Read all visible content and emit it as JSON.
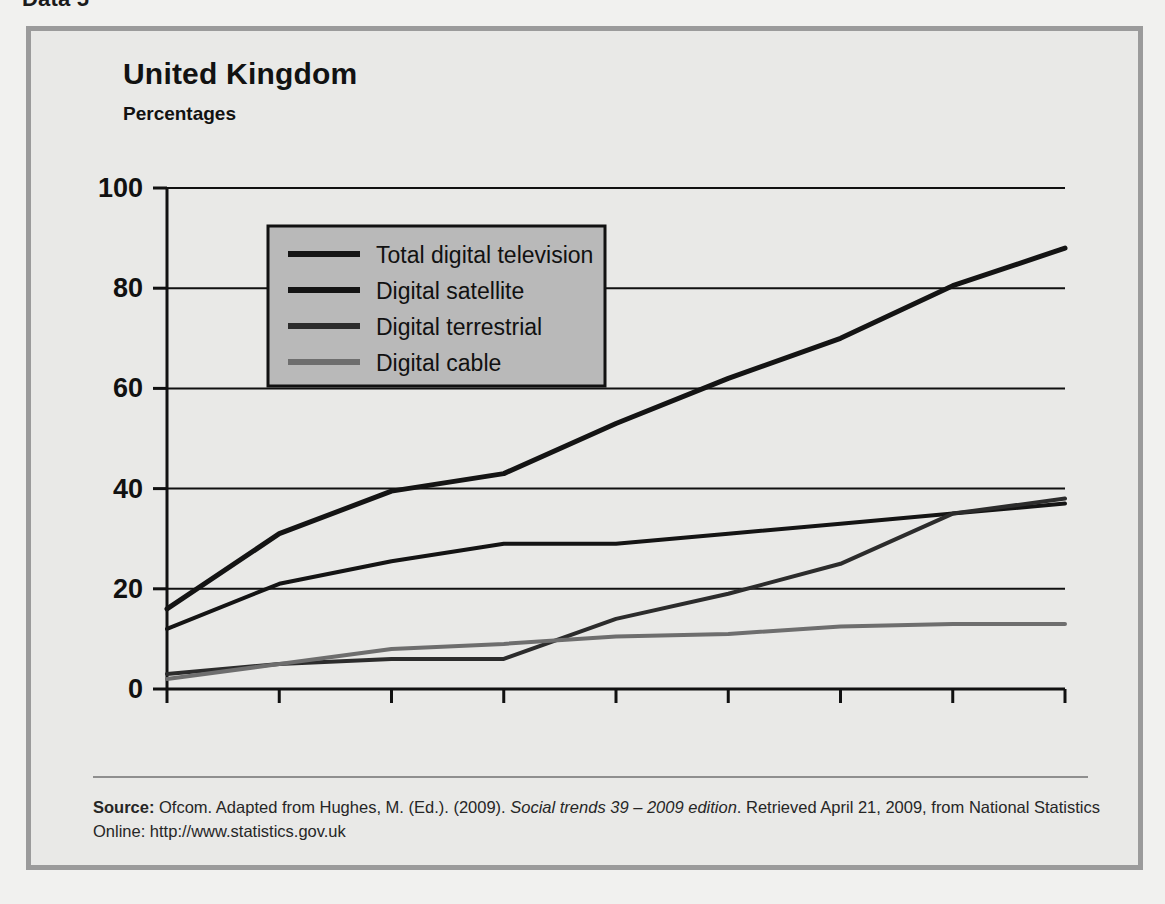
{
  "crop_caption": "Data 5",
  "figure": {
    "title": "United Kingdom",
    "subtitle": "Percentages"
  },
  "source": {
    "label": "Source:",
    "text_before_italic": " Ofcom. Adapted from Hughes, M. (Ed.). (2009). ",
    "italic_text": "Social trends 39 – 2009 edition",
    "text_after_italic": ". Retrieved April 21, 2009, from National Statistics Online: http://www.statistics.gov.uk"
  },
  "colors": {
    "panel_background": "#e9e9e7",
    "frame_border": "#9b9b9b",
    "axis": "#111111",
    "gridline": "#111111",
    "legend_background": "#b9b9b9",
    "legend_border": "#111111",
    "series_dark": "#141414",
    "series_gray": "#6e6e6e",
    "source_rule": "#8f8f8f"
  },
  "chart_data": {
    "type": "line",
    "title": "United Kingdom",
    "subtitle": "Percentages",
    "xlabel": "",
    "ylabel": "Percentages",
    "categories": [
      "2000",
      "2001",
      "2002",
      "2003",
      "2004",
      "2005",
      "2006",
      "2007",
      "2008"
    ],
    "x": [
      2000,
      2001,
      2002,
      2003,
      2004,
      2005,
      2006,
      2007,
      2008
    ],
    "ylim": [
      0,
      100
    ],
    "yticks": [
      0,
      20,
      40,
      60,
      80,
      100
    ],
    "ytick_labels": [
      "0",
      "20",
      "40",
      "60",
      "80",
      "100"
    ],
    "grid": "horizontal",
    "legend_position": "upper-left-inside",
    "series": [
      {
        "name": "Total digital television",
        "color": "#141414",
        "width": 5,
        "values": [
          16,
          31,
          39.5,
          43,
          53,
          62,
          70,
          80.5,
          88
        ]
      },
      {
        "name": "Digital satellite",
        "color": "#141414",
        "width": 4,
        "values": [
          12,
          21,
          25.5,
          29,
          29,
          31,
          33,
          35,
          37
        ]
      },
      {
        "name": "Digital terrestrial",
        "color": "#2c2c2c",
        "width": 4,
        "values": [
          3,
          5,
          6,
          6,
          14,
          19,
          25,
          35,
          38
        ]
      },
      {
        "name": "Digital cable",
        "color": "#6e6e6e",
        "width": 4,
        "values": [
          2,
          5,
          8,
          9,
          10.5,
          11,
          12.5,
          13,
          13
        ]
      }
    ]
  },
  "legend": {
    "items": [
      {
        "label": "Total digital television",
        "color": "#141414"
      },
      {
        "label": "Digital satellite",
        "color": "#141414"
      },
      {
        "label": "Digital terrestrial",
        "color": "#2c2c2c"
      },
      {
        "label": "Digital cable",
        "color": "#6e6e6e"
      }
    ]
  }
}
